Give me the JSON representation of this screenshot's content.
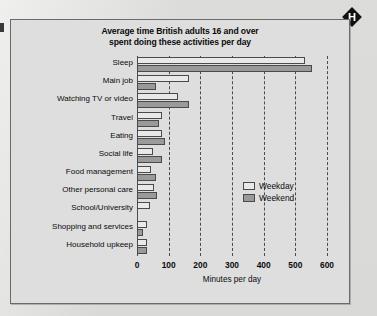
{
  "marker": {
    "letter": "H",
    "name": "h-diamond-marker"
  },
  "chart_data": {
    "type": "bar",
    "orientation": "horizontal",
    "title": "Average time British adults 16 and over spent doing these activities per day",
    "title_line1": "Average time British adults 16 and over",
    "title_line2": "spent doing these activities per day",
    "xlabel": "Minutes per day",
    "ylabel": "",
    "xlim": [
      0,
      600
    ],
    "xticks": [
      0,
      100,
      200,
      300,
      400,
      500,
      600
    ],
    "xtick_labels": [
      "0",
      "100",
      "200",
      "300",
      "400",
      "500",
      "600"
    ],
    "grid": "vertical-dashed",
    "legend_position": "middle-right",
    "categories": [
      "Sleep",
      "Main job",
      "Watching TV or video",
      "Travel",
      "Eating",
      "Social life",
      "Food management",
      "Other personal care",
      "School/University",
      "Shopping and services",
      "Household  upkeep"
    ],
    "series": [
      {
        "name": "Weekday",
        "color": "#e9e9e9",
        "values": [
          530,
          165,
          128,
          80,
          80,
          50,
          45,
          55,
          40,
          30,
          30
        ]
      },
      {
        "name": "Weekend",
        "color": "#9a9a9a",
        "values": [
          552,
          60,
          163,
          70,
          88,
          78,
          60,
          63,
          0,
          18,
          33
        ]
      }
    ]
  }
}
